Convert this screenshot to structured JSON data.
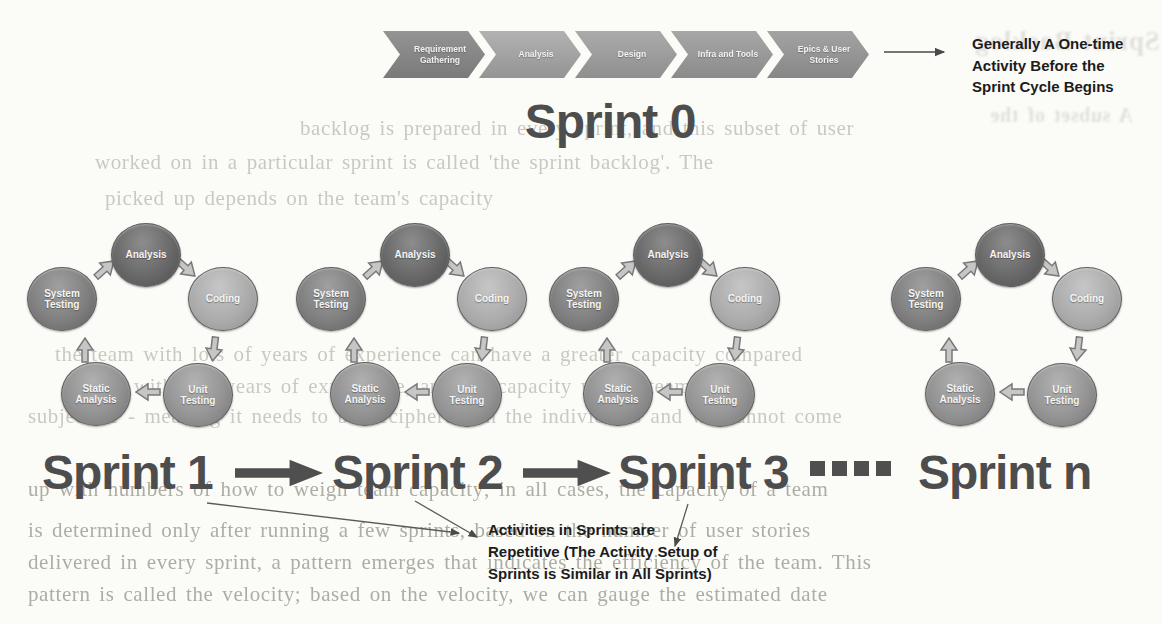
{
  "figure": {
    "process_bar": {
      "steps": [
        "Requirement Gathering",
        "Analysis",
        "Design",
        "Infra and Tools",
        "Epics & User Stories"
      ],
      "note_lines": [
        "Generally A One-time",
        "Activity Before the",
        "Sprint Cycle  Begins"
      ]
    },
    "sprint0_label": "Sprint 0",
    "cycle": {
      "count": 4,
      "stages": [
        "Analysis",
        "Coding",
        "Unit Testing",
        "Static Analysis",
        "System Testing"
      ]
    },
    "sprint_labels": [
      "Sprint 1",
      "Sprint 2",
      "Sprint 3",
      "Sprint n"
    ],
    "ellipsis_square_count": 4,
    "annotation_lines": [
      "Activities in Sprints are",
      "Repetitive (The Activity Setup of",
      "Sprints is Similar in All Sprints)"
    ]
  },
  "ghost_text": {
    "lines": [
      "backlog is prepared in every sprint, and this subset of user",
      "worked on in a particular sprint is called 'the sprint backlog'. The",
      "picked up depends on the team's capacity",
      "the team with lots of years of experience can have a greater capacity compared",
      "size with few years of experience, and the capacity with a team is",
      "subjective - meaning it needs to be deciphered on the individuals and we cannot come",
      "up with numbers of how to weigh team capacity; in all cases, the capacity of a team",
      "is determined only after running a few sprints, based on the number of user stories",
      "delivered in every sprint, a pattern emerges that indicates the efficiency of the team. This",
      "pattern is called the velocity; based on the velocity, we can gauge the estimated date",
      "Sprint Backlog",
      "A subset of the"
    ]
  },
  "colors": {
    "chevron_fill": "#9e9e9e",
    "big_label": "#4d4d4d",
    "circle_analysis": "#696969",
    "circle_coding": "#acacac",
    "circle_unit_testing": "#959595",
    "circle_static_analysis": "#929292",
    "circle_system_testing": "#808080",
    "note_text": "#1c1c1c",
    "thin_arrow": "#5a5a5a"
  }
}
